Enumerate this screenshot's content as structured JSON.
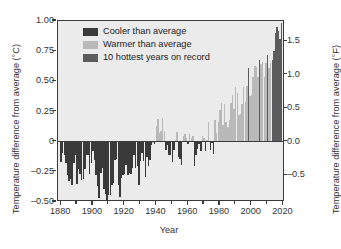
{
  "chart_data": {
    "type": "bar",
    "title": "",
    "xlabel": "Year",
    "ylabel": "Temperature difference from average (°C)",
    "ylabel_right": "Temperature difference from average (°F)",
    "xlim": [
      1878,
      2021
    ],
    "ylim": [
      -0.5,
      1.0
    ],
    "ylim_right": [
      -0.9,
      1.8
    ],
    "grid": false,
    "legend_position": "top-left",
    "axis_left_ticks": [
      "1.00",
      "0.75",
      "0.50",
      "0.25",
      "0",
      "–0.25",
      "–0.50"
    ],
    "axis_left_values": [
      1.0,
      0.75,
      0.5,
      0.25,
      0,
      -0.25,
      -0.5
    ],
    "axis_right_ticks": [
      "1.5",
      "1.0",
      "0.5",
      "0.0",
      "–0.5"
    ],
    "axis_right_values": [
      1.5,
      1.0,
      0.5,
      0.0,
      -0.5
    ],
    "xticks": [
      1880,
      1900,
      1920,
      1940,
      1960,
      1980,
      2000,
      2020
    ],
    "xticks_minor": [
      1890,
      1910,
      1930,
      1950,
      1970,
      1990,
      2010
    ],
    "legend": [
      {
        "label": "Cooler than average",
        "color": "#3a3a3a",
        "key": "cooler"
      },
      {
        "label": "Warmer than average",
        "color": "#b9b9b9",
        "key": "warmer"
      },
      {
        "label": "10 hottest years on record",
        "color": "#5c5c5c",
        "key": "hottest"
      }
    ],
    "colors": {
      "cooler": "#3a3a3a",
      "warmer": "#b9b9b9",
      "hottest": "#5c5c5c",
      "plot_background": "#ebebeb",
      "axis": "#3b3b3b"
    },
    "hottest_years": [
      1998,
      2005,
      2010,
      2013,
      2014,
      2015,
      2016,
      2017,
      2018,
      2019
    ],
    "x": [
      1880,
      1881,
      1882,
      1883,
      1884,
      1885,
      1886,
      1887,
      1888,
      1889,
      1890,
      1891,
      1892,
      1893,
      1894,
      1895,
      1896,
      1897,
      1898,
      1899,
      1900,
      1901,
      1902,
      1903,
      1904,
      1905,
      1906,
      1907,
      1908,
      1909,
      1910,
      1911,
      1912,
      1913,
      1914,
      1915,
      1916,
      1917,
      1918,
      1919,
      1920,
      1921,
      1922,
      1923,
      1924,
      1925,
      1926,
      1927,
      1928,
      1929,
      1930,
      1931,
      1932,
      1933,
      1934,
      1935,
      1936,
      1937,
      1938,
      1939,
      1940,
      1941,
      1942,
      1943,
      1944,
      1945,
      1946,
      1947,
      1948,
      1949,
      1950,
      1951,
      1952,
      1953,
      1954,
      1955,
      1956,
      1957,
      1958,
      1959,
      1960,
      1961,
      1962,
      1963,
      1964,
      1965,
      1966,
      1967,
      1968,
      1969,
      1970,
      1971,
      1972,
      1973,
      1974,
      1975,
      1976,
      1977,
      1978,
      1979,
      1980,
      1981,
      1982,
      1983,
      1984,
      1985,
      1986,
      1987,
      1988,
      1989,
      1990,
      1991,
      1992,
      1993,
      1994,
      1995,
      1996,
      1997,
      1998,
      1999,
      2000,
      2001,
      2002,
      2003,
      2004,
      2005,
      2006,
      2007,
      2008,
      2009,
      2010,
      2011,
      2012,
      2013,
      2014,
      2015,
      2016,
      2017,
      2018,
      2019
    ],
    "values": [
      -0.17,
      -0.09,
      -0.11,
      -0.18,
      -0.28,
      -0.33,
      -0.31,
      -0.36,
      -0.18,
      -0.11,
      -0.35,
      -0.23,
      -0.27,
      -0.32,
      -0.31,
      -0.23,
      -0.11,
      -0.11,
      -0.27,
      -0.18,
      -0.08,
      -0.15,
      -0.28,
      -0.37,
      -0.47,
      -0.26,
      -0.22,
      -0.39,
      -0.43,
      -0.48,
      -0.44,
      -0.44,
      -0.36,
      -0.34,
      -0.15,
      -0.14,
      -0.36,
      -0.46,
      -0.3,
      -0.28,
      -0.27,
      -0.19,
      -0.28,
      -0.26,
      -0.27,
      -0.22,
      -0.11,
      -0.22,
      -0.2,
      -0.36,
      -0.16,
      -0.09,
      -0.16,
      -0.29,
      -0.13,
      -0.2,
      -0.15,
      -0.03,
      0.0,
      -0.02,
      0.13,
      0.19,
      0.07,
      0.09,
      0.2,
      0.09,
      -0.07,
      -0.03,
      -0.11,
      -0.11,
      -0.17,
      -0.07,
      0.01,
      0.08,
      -0.13,
      -0.14,
      -0.19,
      0.05,
      0.06,
      0.03,
      -0.02,
      0.06,
      0.03,
      0.05,
      -0.2,
      -0.11,
      -0.06,
      -0.02,
      -0.08,
      0.05,
      0.03,
      -0.08,
      0.01,
      0.16,
      -0.07,
      -0.01,
      -0.1,
      0.18,
      0.07,
      0.16,
      0.26,
      0.32,
      0.14,
      0.31,
      0.16,
      0.12,
      0.18,
      0.32,
      0.39,
      0.27,
      0.45,
      0.4,
      0.22,
      0.23,
      0.31,
      0.45,
      0.33,
      0.46,
      0.61,
      0.38,
      0.39,
      0.54,
      0.63,
      0.62,
      0.54,
      0.68,
      0.64,
      0.66,
      0.54,
      0.65,
      0.72,
      0.61,
      0.65,
      0.68,
      0.75,
      0.9,
      0.95,
      0.92,
      0.85,
      0.98
    ],
    "categories_note": "Annual global mean temperature anomaly relative to the 20th-century average"
  },
  "caption": {
    "text": ""
  }
}
